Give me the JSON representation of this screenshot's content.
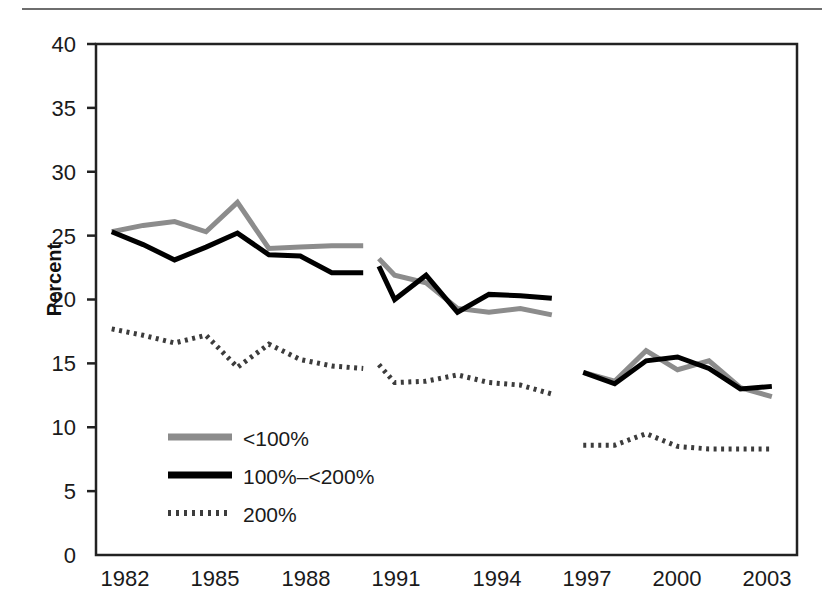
{
  "chart_data": {
    "type": "line",
    "title": "",
    "xlabel": "",
    "ylabel": "Percent",
    "xlim": [
      1981.5,
      2003.8
    ],
    "ylim": [
      0,
      40
    ],
    "ytick_values": [
      0,
      5,
      10,
      15,
      20,
      25,
      30,
      35,
      40
    ],
    "ytick_labels": [
      "0",
      "5",
      "10",
      "15",
      "20",
      "25",
      "30",
      "35",
      "40"
    ],
    "xtick_values": [
      1982,
      1985,
      1988,
      1991,
      1994,
      1997,
      2000,
      2003
    ],
    "xtick_labels": [
      "1982",
      "1985",
      "1988",
      "1991",
      "1994",
      "1997",
      "2000",
      "2003"
    ],
    "grid": false,
    "legend_position": "lower left",
    "note": "Series are drawn as three separate broken segments: 1982-1990, 1990.5-1996, 1997-2003",
    "series": [
      {
        "name": "<100%",
        "style": "solid",
        "color": "#8c8c8c",
        "width": 5,
        "segments": [
          {
            "x": [
              1982,
              1983,
              1984,
              1985,
              1986,
              1987,
              1988,
              1989,
              1990
            ],
            "y": [
              25.3,
              25.8,
              26.1,
              25.3,
              27.6,
              24.0,
              24.1,
              24.2,
              24.2
            ]
          },
          {
            "x": [
              1990.5,
              1991,
              1992,
              1993,
              1994,
              1995,
              1996
            ],
            "y": [
              23.2,
              21.9,
              21.3,
              19.3,
              19.0,
              19.3,
              18.8
            ]
          },
          {
            "x": [
              1997,
              1998,
              1999,
              2000,
              2001,
              2002,
              2003
            ],
            "y": [
              14.3,
              13.6,
              16.0,
              14.5,
              15.2,
              13.1,
              12.4
            ]
          }
        ]
      },
      {
        "name": "100%–<200%",
        "style": "solid",
        "color": "#000000",
        "width": 5,
        "segments": [
          {
            "x": [
              1982,
              1983,
              1984,
              1985,
              1986,
              1987,
              1988,
              1989,
              1990
            ],
            "y": [
              25.3,
              24.3,
              23.1,
              24.1,
              25.2,
              23.5,
              23.4,
              22.1,
              22.1
            ]
          },
          {
            "x": [
              1990.5,
              1991,
              1992,
              1993,
              1994,
              1995,
              1996
            ],
            "y": [
              22.6,
              20.0,
              21.9,
              19.0,
              20.4,
              20.3,
              20.1
            ]
          },
          {
            "x": [
              1997,
              1998,
              1999,
              2000,
              2001,
              2002,
              2003
            ],
            "y": [
              14.3,
              13.4,
              15.2,
              15.5,
              14.6,
              13.0,
              13.2
            ]
          }
        ]
      },
      {
        "name": "200%",
        "style": "dotted",
        "color": "#3c3c3c",
        "width": 5,
        "segments": [
          {
            "x": [
              1982,
              1983,
              1984,
              1985,
              1986,
              1987,
              1988,
              1989,
              1990
            ],
            "y": [
              17.7,
              17.2,
              16.6,
              17.2,
              14.7,
              16.5,
              15.3,
              14.8,
              14.6
            ]
          },
          {
            "x": [
              1990.5,
              1991,
              1992,
              1993,
              1994,
              1995,
              1996
            ],
            "y": [
              14.9,
              13.5,
              13.6,
              14.1,
              13.5,
              13.3,
              12.6
            ]
          },
          {
            "x": [
              1997,
              1998,
              1999,
              2000,
              2001,
              2002,
              2003
            ],
            "y": [
              8.6,
              8.6,
              9.5,
              8.5,
              8.3,
              8.3,
              8.3
            ]
          }
        ]
      }
    ]
  },
  "legend": {
    "items": [
      {
        "label": "<100%",
        "swatch": "gray-solid-line"
      },
      {
        "label": "100%–<200%",
        "swatch": "black-solid-line"
      },
      {
        "label": "200%",
        "swatch": "dotted-line"
      }
    ]
  },
  "colors": {
    "series_low": "#8c8c8c",
    "series_mid": "#000000",
    "series_high": "#3c3c3c",
    "axis": "#222222",
    "rule": "#6e6e6e"
  }
}
